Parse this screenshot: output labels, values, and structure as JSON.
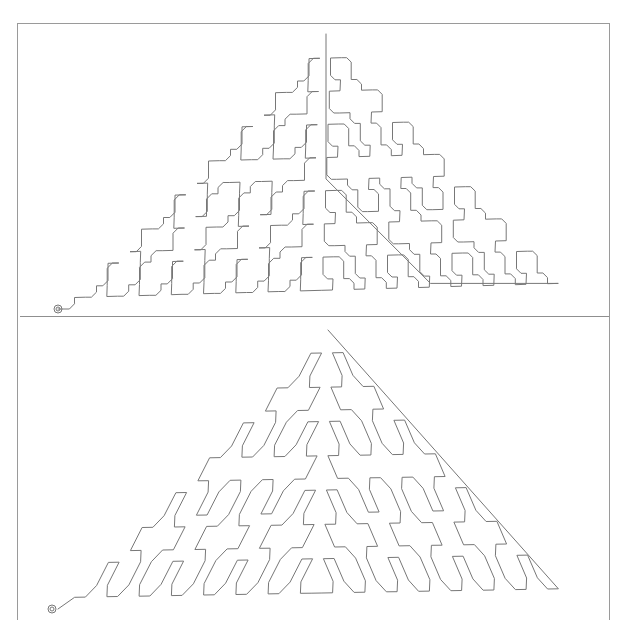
{
  "figure": {
    "panels": [
      {
        "id": "top",
        "style": "orthogonal-rounded",
        "description": "Space-filling curve in right isosceles triangle drawn with orthogonal segments and chamfered corners",
        "start_marker": "double-circle",
        "start": [
          40,
          285
        ],
        "apex": [
          308,
          12
        ],
        "base_right": [
          556,
          270
        ]
      },
      {
        "id": "bottom",
        "style": "diagonal",
        "description": "Same triangle-filling curve drawn with diagonal 45° segments",
        "start_marker": "double-circle",
        "start": [
          40,
          291
        ],
        "apex": [
          310,
          12
        ],
        "base_right": [
          556,
          282
        ]
      }
    ],
    "colors": {
      "line": "#777777",
      "frame": "#9a9a9a",
      "background": "#ffffff"
    }
  }
}
